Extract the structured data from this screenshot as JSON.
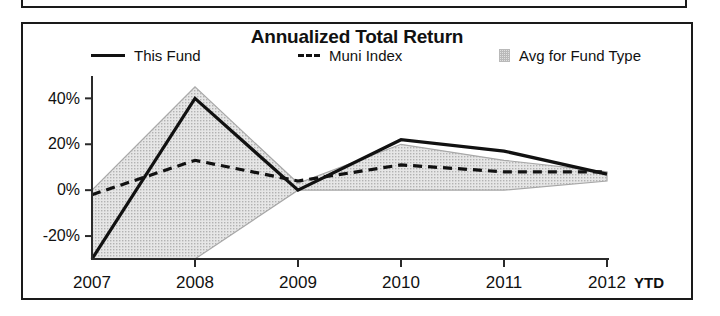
{
  "chart_panel": {
    "title": "Annualized Total Return"
  },
  "legend": {
    "items": [
      {
        "label": "This Fund",
        "marker": "solid-line-swatch",
        "color": "#111111"
      },
      {
        "label": "Muni Index",
        "marker": "dashed-line-swatch",
        "color": "#111111",
        "prefix": "---"
      },
      {
        "label": "Avg for Fund Type",
        "marker": "area-swatch",
        "color": "#d6d6d6"
      }
    ]
  },
  "axes": {
    "y_tick_labels": [
      "40%",
      "20%",
      "0%",
      "-20%"
    ],
    "x_tick_labels": [
      "2007",
      "2008",
      "2009",
      "2010",
      "2011",
      "2012"
    ],
    "x_axis_suffix": "YTD"
  },
  "chart_data": {
    "type": "line",
    "title": "Annualized Total Return",
    "xlabel": "",
    "ylabel": "",
    "categories": [
      "2007",
      "2008",
      "2009",
      "2010",
      "2011",
      "2012"
    ],
    "x_axis_suffix": "YTD",
    "ylim": [
      -30,
      48
    ],
    "ytick_values": [
      40,
      20,
      0,
      -20
    ],
    "ytick_labels": [
      "40%",
      "20%",
      "0%",
      "-20%"
    ],
    "grid": false,
    "legend_position": "top",
    "series": [
      {
        "name": "This Fund",
        "style": "solid",
        "color": "#111111",
        "values": [
          -30,
          40,
          0,
          22,
          17,
          7
        ]
      },
      {
        "name": "Muni Index",
        "style": "dashed",
        "color": "#111111",
        "values": [
          -2,
          13,
          4,
          11,
          8,
          8
        ]
      },
      {
        "name": "Avg for Fund Type",
        "style": "band",
        "color": "#d6d6d6",
        "upper_values": [
          0,
          45,
          3,
          20,
          13,
          8
        ],
        "lower_values": [
          -30,
          -30,
          0,
          0,
          0,
          4
        ]
      }
    ]
  }
}
